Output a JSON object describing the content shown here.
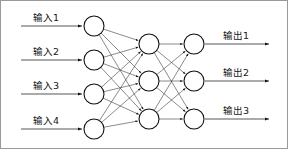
{
  "diagram": {
    "type": "neural-network",
    "title": "",
    "background_color": "#ffffff",
    "stroke_color": "#2b2b2b",
    "node_fill": "#ffffff",
    "node_stroke": "#101010",
    "frame_color": "#9a9a9a"
  },
  "layers": [
    {
      "name": "input-layer",
      "node_count": 4,
      "x": 93,
      "radius": 10,
      "nodes": [
        {
          "id": "in-1",
          "cy": 25
        },
        {
          "id": "in-2",
          "cy": 59
        },
        {
          "id": "in-3",
          "cy": 93
        },
        {
          "id": "in-4",
          "cy": 128
        }
      ]
    },
    {
      "name": "hidden-layer",
      "node_count": 3,
      "x": 148,
      "radius": 10,
      "nodes": [
        {
          "id": "hid-1",
          "cy": 43
        },
        {
          "id": "hid-2",
          "cy": 80
        },
        {
          "id": "hid-3",
          "cy": 118
        }
      ]
    },
    {
      "name": "output-layer",
      "node_count": 3,
      "x": 193,
      "radius": 10,
      "nodes": [
        {
          "id": "out-1",
          "cy": 43
        },
        {
          "id": "out-2",
          "cy": 80
        },
        {
          "id": "out-3",
          "cy": 118
        }
      ]
    }
  ],
  "input_labels": [
    {
      "text": "输入1",
      "x": 32,
      "y": 20,
      "line_y": 25,
      "line_x1": 20,
      "line_x2": 81
    },
    {
      "text": "输入2",
      "x": 32,
      "y": 54,
      "line_y": 59,
      "line_x1": 20,
      "line_x2": 81
    },
    {
      "text": "输入3",
      "x": 32,
      "y": 88,
      "line_y": 93,
      "line_x1": 20,
      "line_x2": 81
    },
    {
      "text": "输入4",
      "x": 32,
      "y": 123,
      "line_y": 128,
      "line_x1": 20,
      "line_x2": 81
    }
  ],
  "output_labels": [
    {
      "text": "输出1",
      "x": 222,
      "y": 38,
      "line_y": 43,
      "line_x1": 204,
      "line_x2": 268
    },
    {
      "text": "输出2",
      "x": 222,
      "y": 75,
      "line_y": 80,
      "line_x1": 204,
      "line_x2": 268
    },
    {
      "text": "输出3",
      "x": 222,
      "y": 113,
      "line_y": 118,
      "line_x1": 204,
      "line_x2": 268
    }
  ],
  "connections": {
    "input_to_hidden": "fully-connected",
    "hidden_to_output": "fully-connected",
    "arrowheads": true
  }
}
